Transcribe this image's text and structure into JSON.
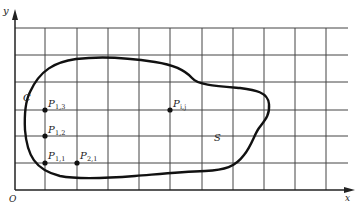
{
  "diagram": {
    "type": "grid-domain",
    "axes": {
      "x_label": "x",
      "y_label": "y",
      "origin_label": "O"
    },
    "grid": {
      "vertical_lines_x": [
        45,
        77,
        108,
        139,
        170,
        202,
        233,
        264,
        295,
        326
      ],
      "horizontal_lines_y": [
        28,
        55,
        82,
        110,
        136,
        163
      ],
      "x_axis_y": 190,
      "y_axis_x": 15,
      "right_edge": 348
    },
    "curve_label": "C",
    "region_label": "S",
    "points": [
      {
        "name": "P",
        "sub": "1,3",
        "x": 45,
        "y": 110
      },
      {
        "name": "P",
        "sub": "1,2",
        "x": 45,
        "y": 136
      },
      {
        "name": "P",
        "sub": "1,1",
        "x": 45,
        "y": 163
      },
      {
        "name": "P",
        "sub": "2,1",
        "x": 77,
        "y": 163
      },
      {
        "name": "P",
        "sub": "i,j",
        "x": 170,
        "y": 110
      }
    ],
    "colors": {
      "line": "#222222",
      "grid": "#333333",
      "background": "#ffffff"
    }
  }
}
